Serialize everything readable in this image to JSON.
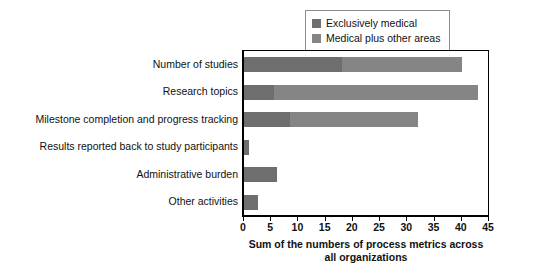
{
  "chart_data": {
    "type": "bar",
    "orientation": "horizontal",
    "stacked": true,
    "title": "",
    "xlabel_line1": "Sum of the numbers of process metrics across",
    "xlabel_line2": "all organizations",
    "ylabel": "",
    "categories": [
      "Number of studies",
      "Research topics",
      "Milestone completion and progress tracking",
      "Results reported back to study participants",
      "Administrative burden",
      "Other activities"
    ],
    "series": [
      {
        "name": "Exclusively medical",
        "color": "#6e6e6e",
        "values": [
          18,
          5.5,
          8.5,
          1,
          6,
          2.5
        ]
      },
      {
        "name": "Medical plus other areas",
        "color": "#858585",
        "values": [
          22,
          37.5,
          23.5,
          0,
          0,
          0
        ]
      }
    ],
    "totals": [
      40,
      43,
      32,
      1,
      6,
      2.5
    ],
    "xlim": [
      0,
      45
    ],
    "xticks": [
      0,
      5,
      10,
      15,
      20,
      25,
      30,
      35,
      40,
      45
    ],
    "xticklabels": [
      "0",
      "5",
      "10",
      "15",
      "20",
      "25",
      "30",
      "35",
      "40",
      "45"
    ],
    "grid": false,
    "legend_position": "top-right",
    "legend_entries": [
      {
        "label": "Exclusively medical",
        "color": "#6e6e6e"
      },
      {
        "label": "Medical plus other areas",
        "color": "#858585"
      }
    ]
  }
}
